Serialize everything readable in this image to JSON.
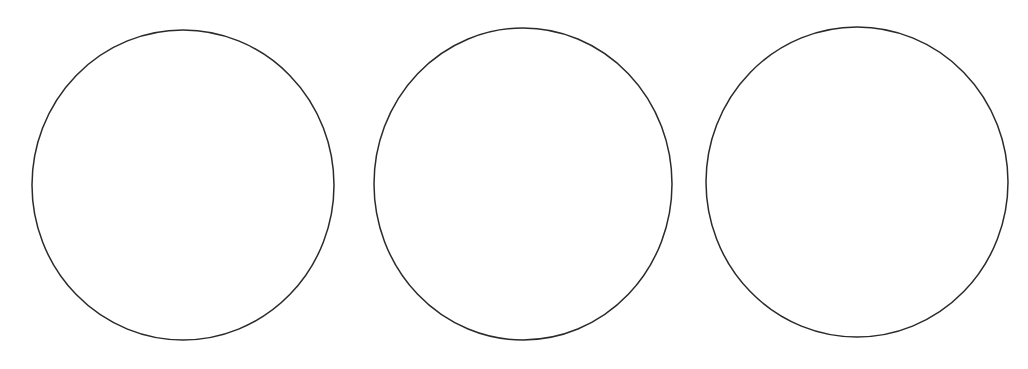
{
  "diagram": {
    "background": "#ffffff",
    "stroke_color": "#2a2a2a",
    "stroke_width": 1.5,
    "shapes": [
      {
        "type": "circle",
        "cx": 183,
        "cy": 185,
        "rx": 151,
        "ry": 155
      },
      {
        "type": "circle",
        "cx": 523,
        "cy": 184,
        "rx": 149,
        "ry": 156
      },
      {
        "type": "circle",
        "cx": 857,
        "cy": 182,
        "rx": 151,
        "ry": 155
      }
    ]
  }
}
